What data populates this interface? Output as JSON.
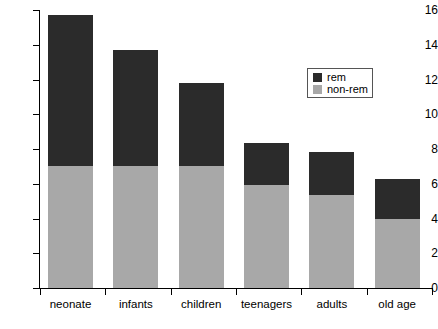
{
  "chart_data": {
    "type": "bar",
    "stacked": true,
    "title": "",
    "subtitle": "",
    "xlabel": "",
    "ylabel": "",
    "categories": [
      "neonate",
      "infants",
      "children",
      "teenagers",
      "adults",
      "old age"
    ],
    "series": [
      {
        "name": "non-rem",
        "color": "#a8a8a8",
        "values": [
          7.0,
          7.0,
          7.0,
          5.95,
          5.35,
          3.95
        ]
      },
      {
        "name": "rem",
        "color": "#2b2b2b",
        "values": [
          8.7,
          6.7,
          4.8,
          2.4,
          2.5,
          2.3
        ]
      }
    ],
    "totals": [
      15.7,
      13.7,
      11.8,
      8.35,
      7.85,
      6.25
    ],
    "ylim": [
      0,
      16
    ],
    "y_ticks": [
      0,
      2,
      4,
      6,
      8,
      10,
      12,
      14,
      16
    ],
    "y_tick_labels": [
      "0",
      "2",
      "4",
      "6",
      "8",
      "10",
      "12",
      "14",
      "16"
    ],
    "grid": false,
    "legend_position": "upper right",
    "legend_entries": [
      {
        "label": "rem",
        "color": "#2b2b2b"
      },
      {
        "label": "non-rem",
        "color": "#a8a8a8"
      }
    ]
  },
  "colors": {
    "rem": "#2b2b2b",
    "non_rem": "#a8a8a8",
    "axis": "#000000",
    "background": "#ffffff",
    "legend_border": "#555555"
  }
}
